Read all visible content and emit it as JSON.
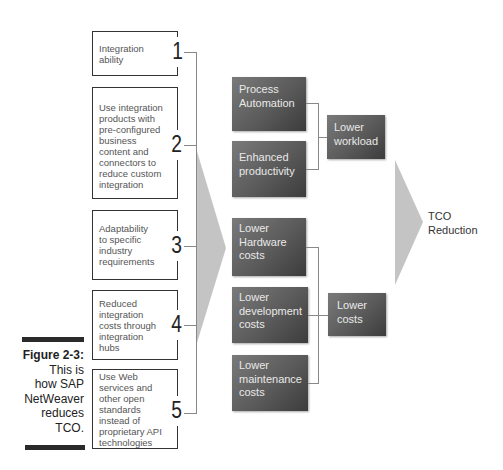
{
  "figure": {
    "label": "Figure 2-3:",
    "caption_lines": [
      "This is",
      "how SAP",
      "NetWeaver",
      "reduces",
      "TCO."
    ]
  },
  "left_factors": [
    {
      "number": "1",
      "text": "Integration ability"
    },
    {
      "number": "2",
      "text": "Use integration products with pre-configured business content and connectors to reduce custom integration"
    },
    {
      "number": "3",
      "text": "Adaptability to specific industry requirements"
    },
    {
      "number": "4",
      "text": "Reduced integration costs through integration hubs"
    },
    {
      "number": "5",
      "text": "Use Web services and other open standards instead of proprietary API technologies"
    }
  ],
  "benefits": [
    {
      "text": "Process Automation"
    },
    {
      "text": "Enhanced productivity"
    },
    {
      "text": "Lower Hardware costs"
    },
    {
      "text": "Lower development costs"
    },
    {
      "text": "Lower maintenance costs"
    }
  ],
  "outcomes": [
    {
      "text": "Lower workload"
    },
    {
      "text": "Lower costs"
    }
  ],
  "result": {
    "text": "TCO Reduction"
  },
  "colors": {
    "chevron": "#c4c4c4",
    "dark_box": "#5a5a5a",
    "box_border": "#333333",
    "connector": "#888888"
  }
}
